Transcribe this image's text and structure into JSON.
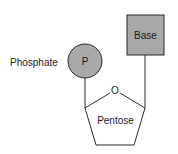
{
  "diagram": {
    "phosphate": {
      "label": "Phosphate",
      "symbol": "P",
      "fill": "#a9a9a9"
    },
    "base": {
      "label": "Base",
      "fill": "#a8a8a8"
    },
    "sugar": {
      "label": "Pentose",
      "ring_oxygen": "O"
    },
    "colors": {
      "stroke": "#2a2a2a",
      "text": "#1a1a1a",
      "background": "#ffffff"
    }
  }
}
